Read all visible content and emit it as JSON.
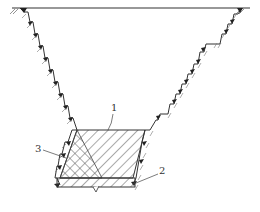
{
  "figure": {
    "type": "cross-section of stepped excavation with backfill",
    "labels": [
      {
        "id": "1",
        "text": "1",
        "target": "backfill body (diagonal hatch)"
      },
      {
        "id": "2",
        "text": "2",
        "target": "base layer"
      },
      {
        "id": "3",
        "text": "3",
        "target": "cross-hatched zone"
      }
    ],
    "caption": ""
  },
  "colors": {
    "line": "#333333",
    "hatch": "#555555",
    "background": "#ffffff"
  }
}
